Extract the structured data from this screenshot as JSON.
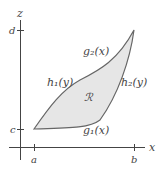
{
  "axes": {
    "x_label": "x",
    "y_label": "z",
    "x_ticks": [
      "a",
      "b"
    ],
    "y_ticks": [
      "c",
      "d"
    ]
  },
  "curves": {
    "g1": "g₁(x)",
    "g2": "g₂(x)",
    "h1": "h₁(y)",
    "h2": "h₂(y)"
  },
  "region": {
    "label": "ℛ",
    "fill": "#e6e6e6",
    "stroke": "#555555"
  }
}
